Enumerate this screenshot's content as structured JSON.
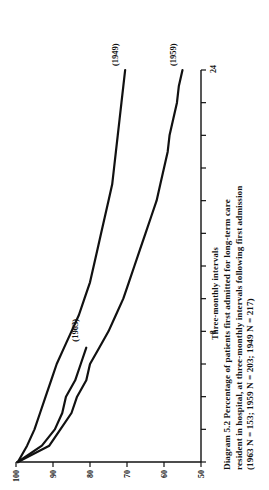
{
  "figure": {
    "caption_lines": [
      "Diagram  5.2   Percentage  of  patients  first  admitted  for  long-term  care",
      "resident in hospital, at three-monthly intervals following first admission",
      "(1963 N = 153; 1959 N = 203; 1949 N = 217)"
    ],
    "caption_full": "Diagram 5.2 Percentage of patients first admitted for long-term care resident in hospital, at three-monthly intervals following first admission (1963 N = 153; 1959 N = 203; 1949 N = 217)"
  },
  "chart_data": {
    "type": "line",
    "title": "Percentage of patients first admitted for long-term care resident in hospital, at three-monthly intervals following first admission",
    "xlabel": "Three-monthly intervals",
    "ylabel": "% of cohort",
    "xlim": [
      0,
      24
    ],
    "ylim": [
      50,
      100
    ],
    "xticks": [
      0,
      2,
      4,
      6,
      8,
      10,
      12,
      14,
      16,
      18,
      20,
      22,
      24
    ],
    "xtick_labels": [
      "",
      "",
      "",
      "",
      "8",
      "",
      "",
      "",
      "",
      "",
      "",
      "",
      "24"
    ],
    "yticks": [
      100,
      90,
      80,
      70,
      60,
      50
    ],
    "ytick_labels": [
      "100",
      "90",
      "80",
      "70",
      "60",
      "50"
    ],
    "grid": false,
    "legend": "inline-annotations",
    "orientation": "rotated-90-ccw",
    "series": [
      {
        "name": "1963",
        "label": "(1963)",
        "n": 153,
        "x": [
          0,
          1,
          2,
          3,
          4,
          5,
          6,
          7
        ],
        "values": [
          99.5,
          93.0,
          89.5,
          87.5,
          86.5,
          84.0,
          82.5,
          81.0
        ]
      },
      {
        "name": "1959",
        "label": "(1959)",
        "n": 203,
        "x": [
          0,
          1,
          2,
          3,
          4,
          5,
          6,
          7,
          8,
          9,
          10,
          11,
          12,
          13,
          14,
          15,
          16,
          17,
          18,
          19,
          20,
          21,
          22,
          23,
          24
        ],
        "values": [
          99.5,
          91.0,
          88.0,
          85.0,
          83.5,
          81.0,
          80.0,
          77.5,
          75.0,
          73.0,
          71.0,
          69.5,
          68.0,
          66.5,
          65.0,
          63.5,
          62.0,
          61.0,
          60.0,
          59.0,
          58.5,
          57.5,
          56.5,
          56.0,
          55.0
        ]
      },
      {
        "name": "1949",
        "label": "(1949)",
        "n": 217,
        "x": [
          0,
          1,
          2,
          3,
          4,
          5,
          6,
          7,
          8,
          9,
          10,
          11,
          12,
          13,
          14,
          15,
          16,
          17,
          18,
          19,
          20,
          21,
          22,
          23,
          24
        ],
        "values": [
          99.5,
          97.0,
          95.0,
          93.5,
          92.0,
          90.5,
          89.0,
          87.0,
          85.0,
          83.0,
          81.5,
          80.0,
          79.0,
          78.0,
          77.0,
          76.0,
          75.0,
          74.0,
          73.5,
          73.0,
          72.5,
          72.0,
          71.5,
          71.0,
          70.5
        ]
      }
    ]
  }
}
